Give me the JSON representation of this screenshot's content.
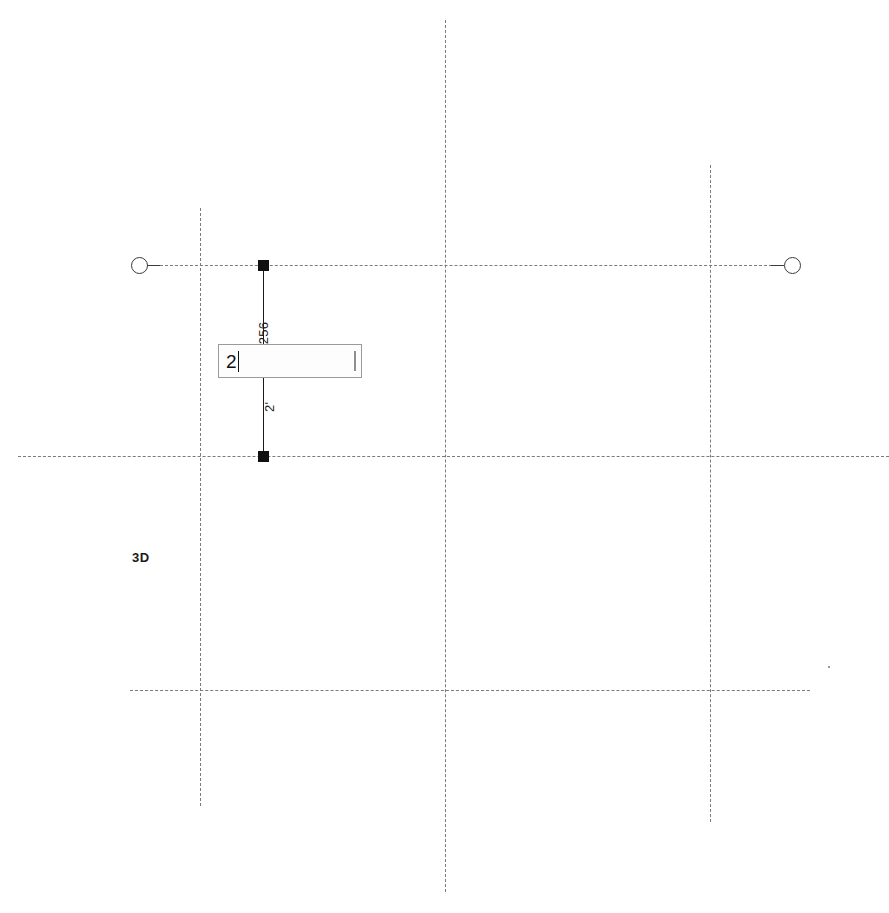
{
  "canvas": {
    "width": 889,
    "height": 913,
    "background": "#ffffff",
    "view_label": "3D"
  },
  "colors": {
    "grid_line": "#7b7b7b",
    "element_line": "#1a1a1a",
    "endpoint_fill": "#111111",
    "input_border": "#9a9a9a",
    "input_background": "#fdfdfd",
    "text": "#1d1d1d"
  },
  "grid": {
    "vertical_lines": [
      {
        "name": "grid-line-left",
        "x": 200,
        "y_top": 208,
        "y_bottom": 806
      },
      {
        "name": "grid-line-center",
        "x": 445,
        "y_top": 20,
        "y_bottom": 892
      },
      {
        "name": "grid-line-right",
        "x": 710,
        "y_top": 165,
        "y_bottom": 822
      }
    ],
    "horizontal_lines": [
      {
        "name": "grid-line-top",
        "y": 265,
        "x_left": 150,
        "x_right": 782
      },
      {
        "name": "grid-line-middle",
        "y": 456,
        "x_left": 18,
        "x_right": 889
      },
      {
        "name": "grid-line-bottom",
        "y": 690,
        "x_left": 130,
        "x_right": 810
      }
    ],
    "bubbles": [
      {
        "name": "grid-bubble-left",
        "cx": 139,
        "cy": 265,
        "stub_side": "right"
      },
      {
        "name": "grid-bubble-right",
        "cx": 792,
        "cy": 265,
        "stub_side": "left"
      }
    ]
  },
  "element": {
    "type": "wall",
    "line": {
      "x": 263,
      "y_start": 265,
      "y_end": 456
    },
    "endpoints": [
      {
        "name": "wall-endpoint-start",
        "x": 263,
        "y": 265
      },
      {
        "name": "wall-endpoint-end",
        "x": 263,
        "y": 456
      }
    ]
  },
  "dimensions": {
    "upper_label": "/256",
    "lower_label": "2'"
  },
  "input": {
    "value": "2",
    "caret_visible": true,
    "box": {
      "x": 218,
      "y": 344,
      "width": 144,
      "height": 34
    }
  },
  "dot": {
    "x": 828,
    "y": 666
  }
}
